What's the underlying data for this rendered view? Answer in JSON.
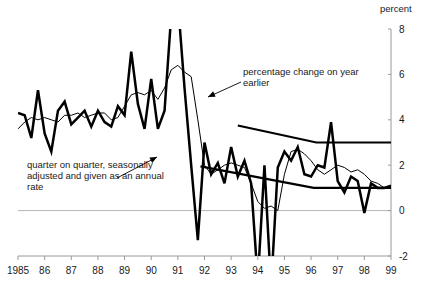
{
  "chart_data": {
    "type": "line",
    "title": "",
    "xlabel": "",
    "ylabel": "percent",
    "unit_label": "percent",
    "xlim": [
      1985.0,
      1999.0
    ],
    "ylim": [
      -2,
      8
    ],
    "yticks": [
      -2,
      0,
      2,
      4,
      6,
      8
    ],
    "ytick_labels": [
      "-2",
      "0",
      "2",
      "4",
      "6",
      "8"
    ],
    "xticks": [
      1985,
      1986,
      1987,
      1988,
      1989,
      1990,
      1991,
      1992,
      1993,
      1994,
      1995,
      1996,
      1997,
      1998,
      1999
    ],
    "xtick_labels": [
      "1985",
      "86",
      "87",
      "88",
      "89",
      "90",
      "91",
      "92",
      "93",
      "94",
      "95",
      "96",
      "97",
      "98",
      "99"
    ],
    "grid": false,
    "legend_position": "inline-annotations",
    "zero_line": true,
    "clipped_note": "thick series is clipped by the axis limits at +8 (1990.75-1991.0) and at -2 (1993.9, 1994.15)",
    "series": [
      {
        "name": "quarter on quarter, seasonally adjusted and given as an annual rate",
        "style": "thick",
        "color": "#000000",
        "x": [
          1985.0,
          1985.25,
          1985.5,
          1985.75,
          1986.0,
          1986.25,
          1986.5,
          1986.75,
          1987.0,
          1987.25,
          1987.5,
          1987.75,
          1988.0,
          1988.25,
          1988.5,
          1988.75,
          1989.0,
          1989.25,
          1989.5,
          1989.75,
          1990.0,
          1990.25,
          1990.5,
          1990.75,
          1991.0,
          1991.25,
          1991.5,
          1991.75,
          1992.0,
          1992.25,
          1992.5,
          1992.75,
          1993.0,
          1993.25,
          1993.5,
          1993.75,
          1994.0,
          1994.25,
          1994.5,
          1994.75,
          1995.0,
          1995.25,
          1995.5,
          1995.75,
          1996.0,
          1996.25,
          1996.5,
          1996.75,
          1997.0,
          1997.25,
          1997.5,
          1997.75,
          1998.0,
          1998.25,
          1998.5,
          1998.75,
          1999.0
        ],
        "y": [
          4.3,
          4.2,
          3.2,
          5.3,
          3.4,
          2.6,
          4.4,
          4.8,
          3.8,
          4.1,
          4.4,
          3.7,
          4.4,
          3.9,
          3.7,
          4.6,
          4.2,
          7.0,
          4.7,
          3.6,
          5.8,
          3.6,
          4.4,
          8.6,
          9.2,
          5.4,
          2.0,
          -1.3,
          3.0,
          1.6,
          2.1,
          1.2,
          2.8,
          1.5,
          2.2,
          1.2,
          -3.1,
          2.0,
          -3.4,
          1.9,
          2.6,
          2.2,
          2.8,
          1.6,
          1.5,
          2.0,
          1.9,
          3.9,
          1.3,
          0.8,
          1.5,
          1.3,
          -0.1,
          1.2,
          1.0,
          1.0,
          1.1
        ]
      },
      {
        "name": "percentage change on year earlier",
        "style": "thin",
        "color": "#000000",
        "x": [
          1985.0,
          1985.25,
          1985.5,
          1985.75,
          1986.0,
          1986.25,
          1986.5,
          1986.75,
          1987.0,
          1987.25,
          1987.5,
          1987.75,
          1988.0,
          1988.25,
          1988.5,
          1988.75,
          1989.0,
          1989.25,
          1989.5,
          1989.75,
          1990.0,
          1990.25,
          1990.5,
          1990.75,
          1991.0,
          1991.25,
          1991.5,
          1991.75,
          1992.0,
          1992.25,
          1992.5,
          1992.75,
          1993.0,
          1993.25,
          1993.5,
          1993.75,
          1994.0,
          1994.25,
          1994.5,
          1994.75,
          1995.0,
          1995.25,
          1995.5,
          1995.75,
          1996.0,
          1996.25,
          1996.5,
          1996.75,
          1997.0,
          1997.25,
          1997.5,
          1997.75,
          1998.0,
          1998.25,
          1998.5,
          1998.75,
          1999.0
        ],
        "y": [
          3.6,
          3.9,
          4.1,
          4.0,
          4.1,
          4.0,
          3.9,
          4.2,
          4.2,
          4.3,
          4.1,
          4.2,
          4.3,
          4.3,
          4.0,
          4.1,
          4.6,
          5.1,
          5.2,
          5.1,
          5.3,
          4.9,
          5.4,
          6.2,
          6.4,
          6.1,
          5.9,
          4.0,
          2.0,
          1.6,
          1.8,
          2.0,
          2.1,
          2.0,
          1.9,
          1.2,
          0.4,
          0.1,
          0.2,
          0.0,
          1.6,
          2.6,
          2.7,
          2.5,
          2.2,
          1.8,
          1.6,
          1.8,
          2.0,
          1.9,
          1.7,
          1.8,
          1.6,
          1.3,
          1.2,
          1.0,
          1.0
        ]
      },
      {
        "name": "upper trend line",
        "style": "trend",
        "color": "#000000",
        "x": [
          1993.25,
          1996.2,
          1999.0
        ],
        "y": [
          3.75,
          3.0,
          3.0
        ]
      },
      {
        "name": "lower trend line",
        "style": "trend",
        "color": "#000000",
        "x": [
          1991.85,
          1996.1,
          1999.0
        ],
        "y": [
          1.95,
          1.0,
          1.0
        ]
      }
    ],
    "annotations": [
      {
        "id": "annotation-year-earlier",
        "text_lines": [
          "percentage change on year",
          "earlier"
        ],
        "text_x": 243,
        "text_y": 75,
        "leader_from": [
          241,
          82
        ],
        "leader_to": [
          208,
          97
        ],
        "arrow_at": "leader_to"
      },
      {
        "id": "annotation-quarter-on-quarter",
        "text_lines": [
          "quarter on quarter, seasonally",
          "adjusted and given as an annual",
          "rate"
        ],
        "text_x": 27,
        "text_y": 168,
        "leader_from": [
          117,
          178
        ],
        "leader_to": [
          157,
          157
        ],
        "arrow_at": "leader_to"
      }
    ]
  },
  "axis": {
    "unit_caption": "percent"
  }
}
